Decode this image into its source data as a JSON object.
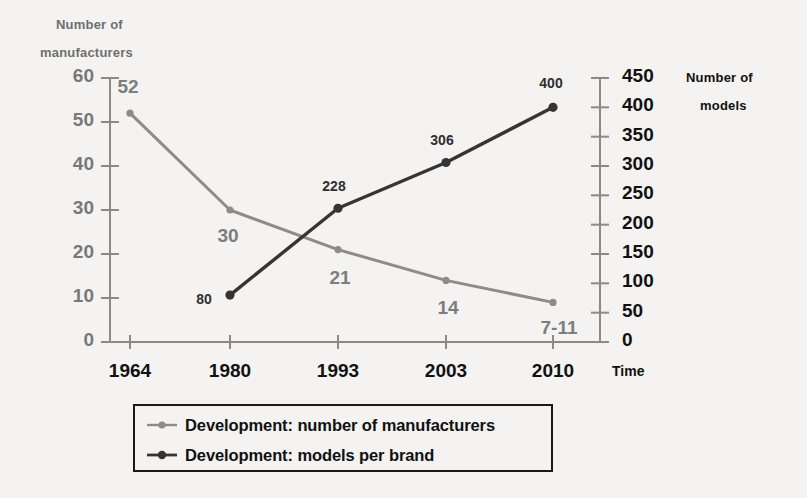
{
  "chart_data": {
    "type": "line",
    "title": "",
    "xlabel": "Time",
    "categories": [
      "1964",
      "1980",
      "1993",
      "2003",
      "2010"
    ],
    "grid": false,
    "legend_position": "bottom",
    "axes": {
      "left": {
        "label_line1": "Number of",
        "label_line2": "manufacturers",
        "ylim": [
          0,
          60
        ],
        "ticks": [
          "60",
          "50",
          "40",
          "30",
          "20",
          "10",
          "0"
        ],
        "tick_values": [
          60,
          50,
          40,
          30,
          20,
          10,
          0
        ],
        "color": "#7d7d7d"
      },
      "right": {
        "label_line1": "Number of",
        "label_line2": "models",
        "ylim": [
          0,
          450
        ],
        "ticks": [
          "450",
          "400",
          "350",
          "300",
          "250",
          "200",
          "150",
          "100",
          "50",
          "0"
        ],
        "tick_values": [
          450,
          400,
          350,
          300,
          250,
          200,
          150,
          100,
          50,
          0
        ],
        "color": "#111111"
      }
    },
    "series": [
      {
        "name": "Development: number of manufacturers",
        "axis": "left",
        "color": "#8c8c8c",
        "x": [
          "1964",
          "1980",
          "1993",
          "2003",
          "2010"
        ],
        "values": [
          52,
          30,
          21,
          14,
          9
        ],
        "point_labels": [
          "52",
          "30",
          "21",
          "14",
          "7-11"
        ]
      },
      {
        "name": "Development: models per brand",
        "axis": "right",
        "color": "#353535",
        "x": [
          "1980",
          "1993",
          "2003",
          "2010"
        ],
        "values": [
          80,
          228,
          306,
          400
        ],
        "point_labels": [
          "80",
          "228",
          "306",
          "400"
        ]
      }
    ]
  },
  "legend": {
    "items": [
      {
        "label": "Development: number of manufacturers",
        "color": "#8c8c8c",
        "marker": "circle-line-marker"
      },
      {
        "label": "Development: models per brand",
        "color": "#353535",
        "marker": "circle-line-marker"
      }
    ]
  }
}
